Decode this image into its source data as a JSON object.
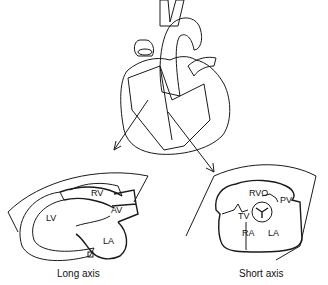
{
  "diagram": {
    "views": [
      {
        "name": "Long axis",
        "labels": [
          "RV",
          "AV",
          "LV",
          "LA"
        ]
      },
      {
        "name": "Short axis",
        "labels": [
          "RVO",
          "PV",
          "TV",
          "RA",
          "LA"
        ]
      }
    ]
  }
}
